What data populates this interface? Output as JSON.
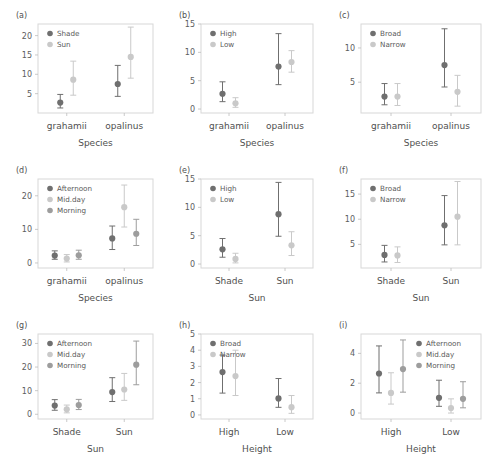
{
  "figure": {
    "type": "multi-panel-interaction-plot",
    "panel_count": 9,
    "colors": {
      "series_dark": "#6f6f6f",
      "series_light": "#c9c9c9",
      "series_mid": "#9d9d9d",
      "frame": "#d7d7d7",
      "text": "#4f4f4f",
      "background": "#ffffff"
    }
  },
  "chart_data": [
    {
      "panel": "(a)",
      "type": "scatter",
      "title": "",
      "xlabel": "Species",
      "ylabel": "",
      "categories": [
        "grahamii",
        "opalinus"
      ],
      "yticks": [
        5,
        10,
        15,
        20
      ],
      "ylim": [
        0,
        23
      ],
      "legend_position": "top-left",
      "series": [
        {
          "name": "Shade",
          "color": "#6f6f6f",
          "values": [
            2.7,
            7.5
          ],
          "err_low": [
            1.3,
            4.3
          ],
          "err_high": [
            4.8,
            12.3
          ]
        },
        {
          "name": "Sun",
          "color": "#c9c9c9",
          "values": [
            8.6,
            14.5
          ],
          "err_low": [
            4.6,
            9.0
          ],
          "err_high": [
            13.4,
            22.2
          ]
        }
      ]
    },
    {
      "panel": "(b)",
      "type": "scatter",
      "title": "",
      "xlabel": "Species",
      "ylabel": "",
      "categories": [
        "grahamii",
        "opalinus"
      ],
      "yticks": [
        0,
        5,
        10,
        15
      ],
      "ylim": [
        -0.7,
        15
      ],
      "legend_position": "top-left",
      "series": [
        {
          "name": "High",
          "color": "#6f6f6f",
          "values": [
            2.7,
            7.5
          ],
          "err_low": [
            1.3,
            4.3
          ],
          "err_high": [
            4.8,
            13.3
          ]
        },
        {
          "name": "Low",
          "color": "#c9c9c9",
          "values": [
            1.0,
            8.3
          ],
          "err_low": [
            0.3,
            6.5
          ],
          "err_high": [
            2.0,
            10.3
          ]
        }
      ]
    },
    {
      "panel": "(c)",
      "type": "scatter",
      "title": "",
      "xlabel": "Species",
      "ylabel": "",
      "categories": [
        "grahamii",
        "opalinus"
      ],
      "yticks": [
        5,
        10
      ],
      "ylim": [
        0.5,
        13.5
      ],
      "legend_position": "top-left",
      "series": [
        {
          "name": "Broad",
          "color": "#6f6f6f",
          "values": [
            2.9,
            7.5
          ],
          "err_low": [
            1.7,
            4.3
          ],
          "err_high": [
            4.8,
            12.8
          ]
        },
        {
          "name": "Narrow",
          "color": "#c9c9c9",
          "values": [
            2.9,
            3.6
          ],
          "err_low": [
            1.6,
            1.5
          ],
          "err_high": [
            4.8,
            6.0
          ]
        }
      ]
    },
    {
      "panel": "(d)",
      "type": "scatter",
      "title": "",
      "xlabel": "Species",
      "ylabel": "",
      "categories": [
        "grahamii",
        "opalinus"
      ],
      "yticks": [
        0,
        10,
        20
      ],
      "ylim": [
        -1.5,
        25
      ],
      "legend_position": "top-left",
      "series": [
        {
          "name": "Afternoon",
          "color": "#6f6f6f",
          "values": [
            2.2,
            7.3
          ],
          "err_low": [
            1.1,
            4.0
          ],
          "err_high": [
            3.6,
            11.0
          ]
        },
        {
          "name": "Mid.day",
          "color": "#c9c9c9",
          "values": [
            1.3,
            16.6
          ],
          "err_low": [
            0.3,
            10.7
          ],
          "err_high": [
            2.5,
            23.2
          ]
        },
        {
          "name": "Morning",
          "color": "#9d9d9d",
          "values": [
            2.3,
            8.7
          ],
          "err_low": [
            1.1,
            5.2
          ],
          "err_high": [
            3.8,
            13.0
          ]
        }
      ]
    },
    {
      "panel": "(e)",
      "type": "scatter",
      "title": "",
      "xlabel": "Sun",
      "ylabel": "",
      "categories": [
        "Shade",
        "Sun"
      ],
      "yticks": [
        0,
        5,
        10,
        15
      ],
      "ylim": [
        -0.7,
        15
      ],
      "legend_position": "top-left",
      "series": [
        {
          "name": "High",
          "color": "#6f6f6f",
          "values": [
            2.6,
            8.8
          ],
          "err_low": [
            1.2,
            4.9
          ],
          "err_high": [
            4.5,
            14.4
          ]
        },
        {
          "name": "Low",
          "color": "#c9c9c9",
          "values": [
            0.9,
            3.3
          ],
          "err_low": [
            0.2,
            1.5
          ],
          "err_high": [
            1.9,
            5.7
          ]
        }
      ]
    },
    {
      "panel": "(f)",
      "type": "scatter",
      "title": "",
      "xlabel": "Sun",
      "ylabel": "",
      "categories": [
        "Shade",
        "Sun"
      ],
      "yticks": [
        5,
        10,
        15
      ],
      "ylim": [
        0.3,
        18
      ],
      "legend_position": "top-left",
      "series": [
        {
          "name": "Broad",
          "color": "#6f6f6f",
          "values": [
            2.9,
            8.8
          ],
          "err_low": [
            1.5,
            4.9
          ],
          "err_high": [
            4.8,
            14.7
          ]
        },
        {
          "name": "Narrow",
          "color": "#c9c9c9",
          "values": [
            2.8,
            10.5
          ],
          "err_low": [
            1.4,
            4.9
          ],
          "err_high": [
            4.5,
            17.5
          ]
        }
      ]
    },
    {
      "panel": "(g)",
      "type": "scatter",
      "title": "",
      "xlabel": "Sun",
      "ylabel": "",
      "categories": [
        "Shade",
        "Sun"
      ],
      "yticks": [
        0,
        10,
        20,
        30
      ],
      "ylim": [
        -2,
        34
      ],
      "legend_position": "top-left",
      "series": [
        {
          "name": "Afternoon",
          "color": "#6f6f6f",
          "values": [
            3.7,
            9.4
          ],
          "err_low": [
            1.7,
            5.4
          ],
          "err_high": [
            6.2,
            15.5
          ]
        },
        {
          "name": "Mid.day",
          "color": "#c9c9c9",
          "values": [
            2.1,
            10.5
          ],
          "err_low": [
            0.6,
            5.9
          ],
          "err_high": [
            3.9,
            17.3
          ]
        },
        {
          "name": "Morning",
          "color": "#9d9d9d",
          "values": [
            3.9,
            21.0
          ],
          "err_low": [
            2.0,
            12.5
          ],
          "err_high": [
            6.3,
            31.0
          ]
        }
      ]
    },
    {
      "panel": "(h)",
      "type": "scatter",
      "title": "",
      "xlabel": "Height",
      "ylabel": "",
      "categories": [
        "High",
        "Low"
      ],
      "yticks": [
        0,
        1,
        2,
        3,
        4,
        5
      ],
      "ylim": [
        -0.25,
        5
      ],
      "legend_position": "top-left",
      "series": [
        {
          "name": "Broad",
          "color": "#6f6f6f",
          "values": [
            2.65,
            1.02
          ],
          "err_low": [
            1.35,
            0.47
          ],
          "err_high": [
            3.7,
            2.25
          ]
        },
        {
          "name": "Narrow",
          "color": "#c9c9c9",
          "values": [
            2.4,
            0.48
          ],
          "err_low": [
            1.2,
            0.1
          ],
          "err_high": [
            4.0,
            1.2
          ]
        }
      ]
    },
    {
      "panel": "(i)",
      "type": "scatter",
      "title": "",
      "xlabel": "Height",
      "ylabel": "",
      "categories": [
        "High",
        "Low"
      ],
      "yticks": [
        0,
        2,
        4
      ],
      "ylim": [
        -0.4,
        5.3
      ],
      "legend_position": "top-right",
      "series": [
        {
          "name": "Afternoon",
          "color": "#6f6f6f",
          "values": [
            2.65,
            1.02
          ],
          "err_low": [
            1.35,
            0.45
          ],
          "err_high": [
            4.5,
            2.2
          ]
        },
        {
          "name": "Mid.day",
          "color": "#c9c9c9",
          "values": [
            1.35,
            0.33
          ],
          "err_low": [
            0.6,
            0.0
          ],
          "err_high": [
            2.7,
            0.95
          ]
        },
        {
          "name": "Morning",
          "color": "#9d9d9d",
          "values": [
            2.95,
            0.95
          ],
          "err_low": [
            1.4,
            0.35
          ],
          "err_high": [
            4.9,
            2.1
          ]
        }
      ]
    }
  ]
}
